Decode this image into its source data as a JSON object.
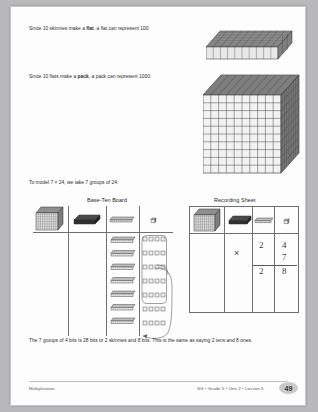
{
  "page": {
    "paragraph_1_pre": "Since 10 skinnies make a ",
    "paragraph_1_bold": "flat",
    "paragraph_1_post": ", a flat can represent 100:",
    "paragraph_2_pre": "Since 10 flats make a ",
    "paragraph_2_bold": "pack",
    "paragraph_2_post": ", a pack can represent 1000:",
    "paragraph_3": "To model 7 × 24, we take 7 groups of 24:",
    "paragraph_4": "The 7 groups of 4 bits is 28 bits or 2 skinnies and 8 bits. This is the same as saying 2 tens and 8 ones."
  },
  "tables": {
    "board_title": "Base-Ten Board",
    "sheet_title": "Recording Sheet",
    "column_icons": [
      "pack-icon",
      "flat-icon",
      "skinny-icon",
      "bit-icon"
    ],
    "board_contents": {
      "packs": 0,
      "flats": 0,
      "skinnies": 7,
      "bit_groups": 7,
      "bits_per_group": 4
    }
  },
  "recording_sheet": {
    "operator": "×",
    "factor_tens": "2",
    "factor_ones": "4",
    "multiplier": "7",
    "product_tens": "2",
    "product_ones": "8"
  },
  "footer": {
    "left": "Multiplication",
    "right": "SG • Grade 5 • Unit 2 • Lesson 5",
    "page_number": "49"
  }
}
